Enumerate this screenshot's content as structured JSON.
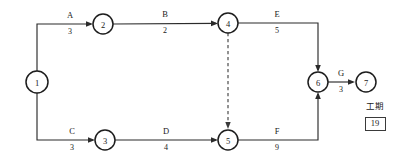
{
  "diagram": {
    "type": "activity-on-arrow-network",
    "title_visible": false,
    "nodes": [
      {
        "id": "1",
        "label": "1",
        "cx": 37,
        "cy": 82,
        "r": 11
      },
      {
        "id": "2",
        "label": "2",
        "cx": 103,
        "cy": 24,
        "r": 10
      },
      {
        "id": "3",
        "label": "3",
        "cx": 105,
        "cy": 140,
        "r": 10
      },
      {
        "id": "4",
        "label": "4",
        "cx": 228,
        "cy": 23,
        "r": 10
      },
      {
        "id": "5",
        "label": "5",
        "cx": 228,
        "cy": 140,
        "r": 10
      },
      {
        "id": "6",
        "label": "6",
        "cx": 318,
        "cy": 82,
        "r": 10
      },
      {
        "id": "7",
        "label": "7",
        "cx": 366,
        "cy": 82,
        "r": 10
      }
    ],
    "activities": [
      {
        "name": "A",
        "duration": "3",
        "from": "1",
        "to": "2",
        "label_x": 70,
        "name_y": 18,
        "dur_y": 32,
        "style": "solid"
      },
      {
        "name": "B",
        "duration": "2",
        "from": "2",
        "to": "4",
        "label_x": 165,
        "name_y": 17,
        "dur_y": 31,
        "style": "solid"
      },
      {
        "name": "C",
        "duration": "3",
        "from": "1",
        "to": "3",
        "label_x": 72,
        "name_y": 134,
        "dur_y": 148,
        "style": "solid"
      },
      {
        "name": "D",
        "duration": "4",
        "from": "3",
        "to": "5",
        "label_x": 166,
        "name_y": 134,
        "dur_y": 148,
        "style": "solid"
      },
      {
        "name": "E",
        "duration": "5",
        "from": "4",
        "to": "6",
        "label_x": 277,
        "name_y": 17,
        "dur_y": 31,
        "style": "solid"
      },
      {
        "name": "F",
        "duration": "9",
        "from": "5",
        "to": "6",
        "label_x": 277,
        "name_y": 134,
        "dur_y": 148,
        "style": "solid"
      },
      {
        "name": "G",
        "duration": "3",
        "from": "6",
        "to": "7",
        "label_x": 342,
        "name_y": 76,
        "dur_y": 90,
        "style": "solid"
      },
      {
        "name": "",
        "duration": "",
        "from": "4",
        "to": "5",
        "label_x": 228,
        "name_y": 0,
        "dur_y": 0,
        "style": "dashed"
      }
    ],
    "duration_panel": {
      "label": "工期",
      "value": "19"
    }
  }
}
